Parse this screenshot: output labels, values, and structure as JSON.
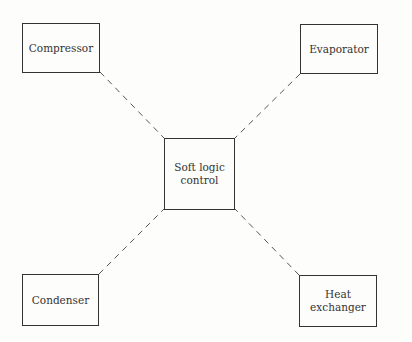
{
  "diagram": {
    "center": {
      "label": "Soft logic control"
    },
    "nodes": [
      {
        "id": "compressor",
        "label": "Compressor"
      },
      {
        "id": "evaporator",
        "label": "Evaporator"
      },
      {
        "id": "condenser",
        "label": "Condenser"
      },
      {
        "id": "heat-exchanger",
        "label": "Heat exchanger"
      }
    ],
    "connections": [
      {
        "from": "soft-logic-control",
        "to": "compressor",
        "style": "dashed"
      },
      {
        "from": "soft-logic-control",
        "to": "evaporator",
        "style": "dashed"
      },
      {
        "from": "soft-logic-control",
        "to": "condenser",
        "style": "dashed"
      },
      {
        "from": "soft-logic-control",
        "to": "heat-exchanger",
        "style": "dashed"
      }
    ],
    "colors": {
      "line": "#333333",
      "background": "#fdfdfb"
    }
  }
}
